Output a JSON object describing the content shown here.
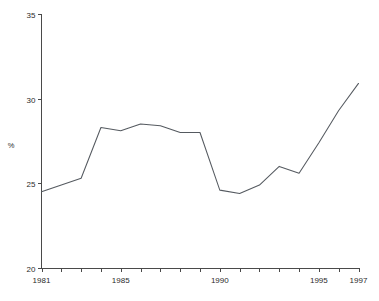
{
  "chart_data": {
    "type": "line",
    "title": "",
    "subtitle": "",
    "xlabel": "",
    "ylabel": "%",
    "xlim": [
      1981,
      1997
    ],
    "ylim": [
      20,
      35
    ],
    "grid": false,
    "legend": null,
    "x_tick_labels": [
      "1981",
      "1985",
      "1990",
      "1995",
      "1997"
    ],
    "x_tick_values": [
      1981,
      1985,
      1990,
      1995,
      1997
    ],
    "x_minor_ticks": [
      1981,
      1982,
      1983,
      1984,
      1985,
      1986,
      1987,
      1988,
      1989,
      1990,
      1991,
      1992,
      1993,
      1994,
      1995,
      1996,
      1997
    ],
    "y_tick_labels": [
      "20",
      "25",
      "30",
      "35"
    ],
    "y_tick_values": [
      20,
      25,
      30,
      35
    ],
    "x": [
      1981,
      1982,
      1983,
      1984,
      1985,
      1986,
      1987,
      1988,
      1989,
      1990,
      1991,
      1992,
      1993,
      1994,
      1995,
      1996,
      1997
    ],
    "values": [
      24.5,
      24.9,
      25.3,
      28.3,
      28.1,
      28.5,
      28.4,
      28.0,
      28.0,
      24.6,
      24.4,
      24.9,
      26.0,
      25.6,
      27.4,
      29.3,
      30.9
    ],
    "series": [
      {
        "name": "",
        "color": "#555a60",
        "values": [
          24.5,
          24.9,
          25.3,
          28.3,
          28.1,
          28.5,
          28.4,
          28.0,
          28.0,
          24.6,
          24.4,
          24.9,
          26.0,
          25.6,
          27.4,
          29.3,
          30.9
        ]
      }
    ],
    "annotations": []
  },
  "axis": {
    "y_label": "%",
    "axis_color": "#4a4a4a",
    "line_color": "#555a60"
  }
}
